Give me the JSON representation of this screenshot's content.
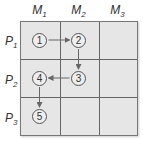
{
  "columns": [
    {
      "base": "M",
      "sub": "1"
    },
    {
      "base": "M",
      "sub": "2"
    },
    {
      "base": "M",
      "sub": "3"
    }
  ],
  "rows": [
    {
      "base": "P",
      "sub": "1"
    },
    {
      "base": "P",
      "sub": "2"
    },
    {
      "base": "P",
      "sub": "3"
    }
  ],
  "nodes": [
    {
      "label": "1",
      "row": 1,
      "col": 1
    },
    {
      "label": "2",
      "row": 1,
      "col": 2
    },
    {
      "label": "3",
      "row": 2,
      "col": 2
    },
    {
      "label": "4",
      "row": 2,
      "col": 1
    },
    {
      "label": "5",
      "row": 3,
      "col": 1
    }
  ],
  "edges": [
    {
      "from": "1",
      "to": "2"
    },
    {
      "from": "2",
      "to": "3"
    },
    {
      "from": "3",
      "to": "4"
    },
    {
      "from": "4",
      "to": "5"
    }
  ],
  "colors": {
    "cell_fill": "#e6e6e6",
    "lines": "#666666",
    "arrow": "#666666"
  }
}
